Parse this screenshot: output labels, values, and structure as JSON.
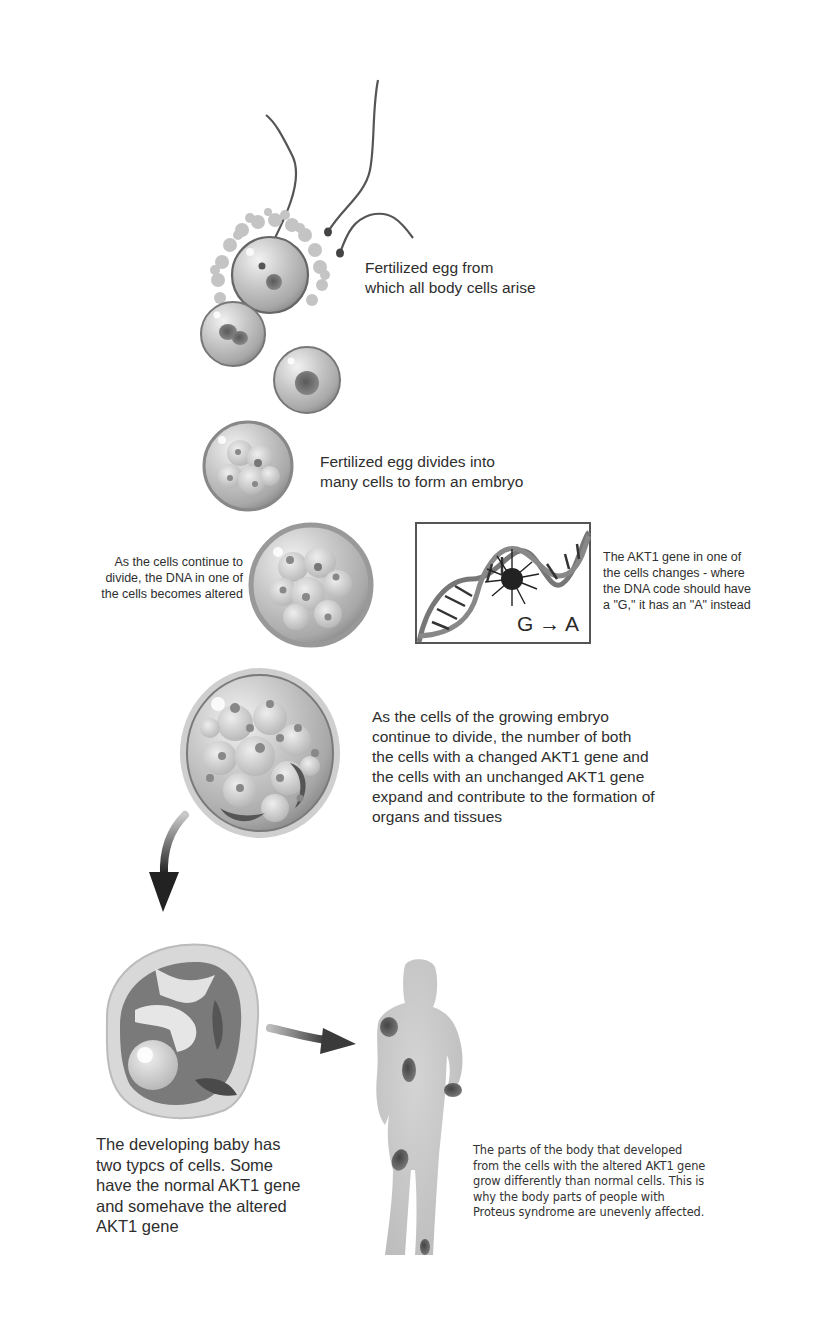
{
  "figure": {
    "topic": "Development of Proteus syndrome from a mosaic AKT1 mutation",
    "colors": {
      "background": "#ffffff",
      "cell_fill": "#b8b8b8",
      "cell_rim": "#8a8a8a",
      "nucleus": "#6a6a6a",
      "patch": "#555555",
      "body_silhouette": "#c4c4c4",
      "text": "#2e2e2e"
    }
  },
  "steps": [
    {
      "id": "fertilized-egg",
      "illustration": "egg-with-sperm",
      "caption": [
        "Fertilized egg from",
        "which all body cells arise"
      ]
    },
    {
      "id": "two-cell",
      "illustration": "dividing-cells",
      "caption": []
    },
    {
      "id": "embryo",
      "illustration": "morula",
      "caption": [
        "Fertilized egg divides into",
        "many cells to form an embryo"
      ]
    },
    {
      "id": "mutation",
      "illustration": "embryo-large",
      "caption_left": [
        "As the cells continue to",
        "divide, the DNA in one of",
        "the cells becomes altered"
      ],
      "dna_panel": {
        "illustration": "dna-double-helix-with-burst",
        "mutation_from": "G",
        "mutation_arrow": "→",
        "mutation_to": "A"
      },
      "caption_right": [
        "The AKT1 gene in one of",
        "the cells changes - where",
        "the DNA code should have",
        "a \"G,\" it has an \"A\" instead"
      ]
    },
    {
      "id": "growing-embryo",
      "illustration": "blastocyst-large",
      "caption": [
        "As the cells of the growing embryo",
        "continue to divide, the number of both",
        "the cells with a changed AKT1 gene and",
        "the cells with an unchanged AKT1 gene",
        "expand and contribute to the formation of",
        "organs and tissues"
      ]
    },
    {
      "id": "developing-baby",
      "illustration": "fetus-in-womb",
      "caption": [
        "The developing baby has",
        "two typcs of cells. Some",
        "have the normal AKT1 gene",
        "and somehave the altered",
        "AKT1 gene"
      ]
    },
    {
      "id": "affected-body",
      "illustration": "human-silhouette-with-patches",
      "caption": [
        "The parts of the body that developed",
        "from the cells with the altered AKT1 gene",
        "grow differently than normal cells. This is",
        "why the body parts of people with",
        "Proteus syndrome are unevenly affected."
      ]
    }
  ]
}
